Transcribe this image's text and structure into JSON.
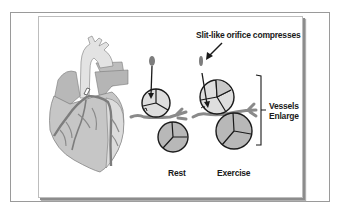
{
  "diagram": {
    "labels": {
      "caption": "Slit-like orifice compresses",
      "vessels_line1": "Vessels",
      "vessels_line2": "Enlarge",
      "rest": "Rest",
      "exercise": "Exercise"
    },
    "elements": [
      {
        "name": "heart-illustration",
        "type": "image"
      },
      {
        "name": "rest-orifice-oval",
        "state": "rest"
      },
      {
        "name": "exercise-orifice-oval",
        "state": "exercise"
      },
      {
        "name": "rest-vessel-cross-sections",
        "count": 2
      },
      {
        "name": "exercise-vessel-cross-sections",
        "count": 2,
        "note": "larger"
      },
      {
        "name": "vessels-enlarge-bracket"
      }
    ],
    "colors": {
      "outline": "#1a1a1a",
      "vessel_gray": "#8a8a8a",
      "oval_fill": "#7d7d7d",
      "light_fill": "#dedede",
      "mid_fill": "#b8b8b8",
      "heart_fill": "#c9c9c9",
      "aorta_fill": "#e3e3e3"
    }
  }
}
